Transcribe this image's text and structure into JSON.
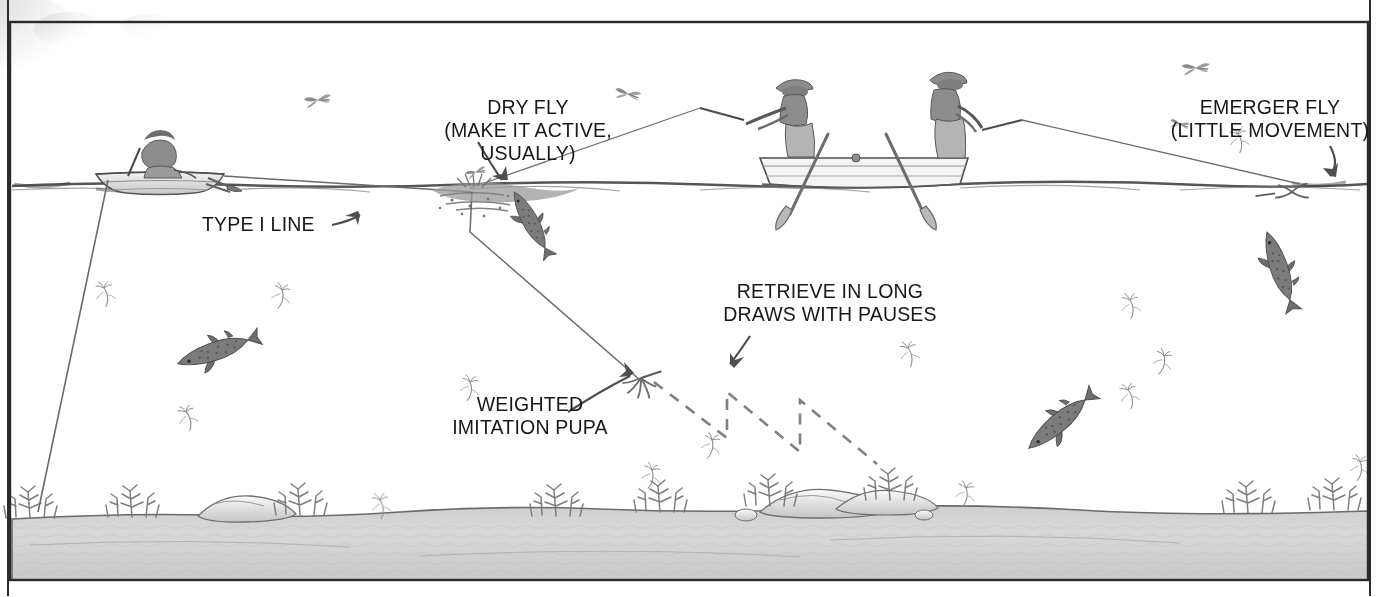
{
  "illustration": {
    "kind": "stillwater-fly-fishing-diagram",
    "frame_color": "#2b2b2b",
    "ink_color": "#4a4a4a",
    "text_color": "#18181a",
    "water_surface_color": "#5c5c5c",
    "lake_bottom_color": "#d6d6d6"
  },
  "labels": {
    "dry_fly": "DRY FLY\n(MAKE IT ACTIVE, USUALLY)",
    "emerger_fly": "EMERGER FLY\n(LITTLE MOVEMENT)",
    "type_i_line": "TYPE I LINE",
    "retrieve": "RETRIEVE IN LONG\nDRAWS WITH PAUSES",
    "weighted_pupa": "WEIGHTED\nIMITATION PUPA"
  },
  "scene_elements": {
    "boats": [
      {
        "name": "small-boat-left",
        "anglers": 1,
        "x": 160,
        "y": 170
      },
      {
        "name": "rowboat-center",
        "anglers": 2,
        "oars": 2,
        "x": 865,
        "y": 180
      }
    ],
    "fish": [
      {
        "name": "rising-trout-dry-fly",
        "x": 520,
        "y": 222
      },
      {
        "name": "rising-trout-emerger",
        "x": 1265,
        "y": 245
      },
      {
        "name": "cruising-trout-left",
        "x": 205,
        "y": 355
      },
      {
        "name": "cruising-trout-right",
        "x": 1035,
        "y": 425
      }
    ],
    "insects": {
      "surface_adults": 5,
      "subsurface_pupae": 14
    },
    "bottom_features": {
      "weed_clumps": 7,
      "rocks": 3
    }
  }
}
